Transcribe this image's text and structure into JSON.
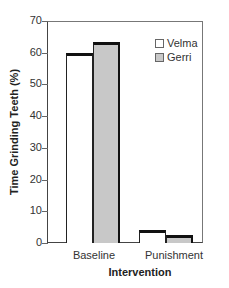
{
  "chart_data": {
    "type": "bar",
    "title": "",
    "xlabel": "Intervention",
    "ylabel": "Time Grinding Teeth (%)",
    "categories": [
      "Baseline",
      "Punishment"
    ],
    "series": [
      {
        "name": "Velma",
        "values": [
          60,
          4
        ],
        "color": "#ffffff"
      },
      {
        "name": "Gerri",
        "values": [
          63.5,
          2.5
        ],
        "color": "#c8c8c8"
      }
    ],
    "ylim": [
      0,
      70
    ],
    "yticks": [
      0,
      10,
      20,
      30,
      40,
      50,
      60,
      70
    ],
    "grid": false,
    "legend_position": "upper right"
  },
  "ytick_labels": [
    "0",
    "10",
    "20",
    "30",
    "40",
    "50",
    "60",
    "70"
  ],
  "legend": {
    "velma": "Velma",
    "gerri": "Gerri"
  }
}
